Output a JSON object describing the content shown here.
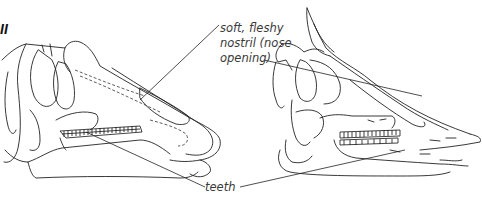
{
  "figure": {
    "marker": "II",
    "subjects": [
      "left-skull",
      "right-skull"
    ]
  },
  "labels": {
    "nostril": {
      "line1": "soft, fleshy",
      "line2": "nostril (nose",
      "line3": "opening)"
    },
    "teeth": "teeth"
  },
  "colors": {
    "ink": "#222222",
    "label_text": "#3a3a3a",
    "background": "#ffffff"
  }
}
